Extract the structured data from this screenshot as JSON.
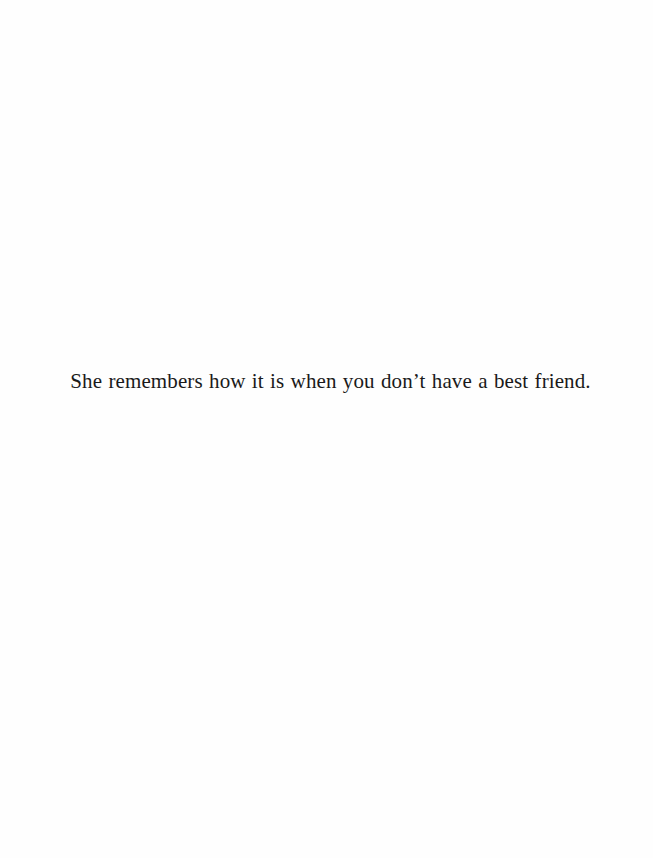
{
  "page": {
    "background": "#fefefe",
    "text_color": "#1a1a1a",
    "lines": [
      "She remembers how it is when you don’t have a best friend."
    ]
  }
}
